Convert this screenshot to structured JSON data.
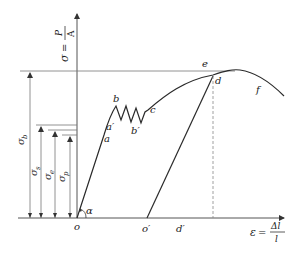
{
  "axes": {
    "y_label_lhs": "σ",
    "y_label_num": "P",
    "y_label_den": "A",
    "x_label_lhs": "ε",
    "x_label_num": "Δl",
    "x_label_den": "l"
  },
  "points": {
    "o": "o",
    "a": "a",
    "a_prime": "a′",
    "b": "b",
    "b_prime": "b′",
    "c": "c",
    "d": "d",
    "e": "e",
    "f": "f",
    "o_prime": "o′",
    "d_prime": "d′",
    "alpha": "α"
  },
  "stress_levels": {
    "sigma_b": {
      "symbol": "σ",
      "sub": "b"
    },
    "sigma_s": {
      "symbol": "σ",
      "sub": "s"
    },
    "sigma_e": {
      "symbol": "σ",
      "sub": "e"
    },
    "sigma_p": {
      "symbol": "σ",
      "sub": "p"
    }
  },
  "colors": {
    "curve": "#2a2a2a",
    "axis": "#555555",
    "reference": "#777777"
  }
}
